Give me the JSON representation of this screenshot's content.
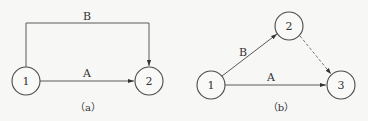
{
  "diagrams": [
    {
      "id": "a",
      "caption": "（a）",
      "nodes": [
        {
          "id": "1",
          "label": "1"
        },
        {
          "id": "2",
          "label": "2"
        }
      ],
      "edges": [
        {
          "from": "1",
          "to": "2",
          "label": "A",
          "style": "solid"
        },
        {
          "from": "1",
          "to": "2",
          "label": "B",
          "style": "solid",
          "routing": "orthogonal-over"
        }
      ]
    },
    {
      "id": "b",
      "caption": "（b）",
      "nodes": [
        {
          "id": "1",
          "label": "1"
        },
        {
          "id": "2",
          "label": "2"
        },
        {
          "id": "3",
          "label": "3"
        }
      ],
      "edges": [
        {
          "from": "1",
          "to": "2",
          "label": "B",
          "style": "solid"
        },
        {
          "from": "1",
          "to": "3",
          "label": "A",
          "style": "solid"
        },
        {
          "from": "2",
          "to": "3",
          "label": "",
          "style": "dashed"
        }
      ]
    }
  ]
}
